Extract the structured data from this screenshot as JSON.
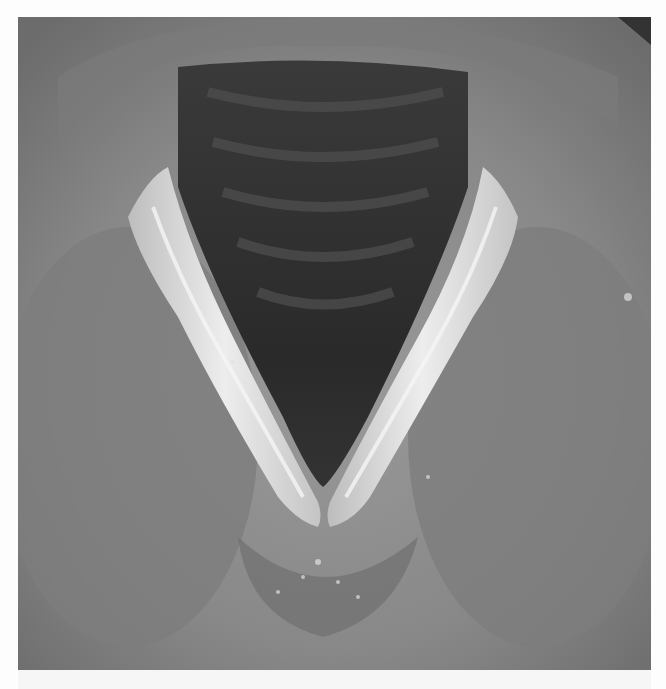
{
  "image": {
    "subject": "endoscopic view of larynx with vocal folds",
    "color_mode": "grayscale",
    "colors": {
      "tissue": "#8a8a8a",
      "tissue_dark": "#6e6e6e",
      "airway": "#2e2e2e",
      "airway_ring": "#4a4a4a",
      "vocal_fold": "#d6d6d6",
      "vocal_fold_highlight": "#f2f2f2",
      "corner_shadow": "#3a3a3a",
      "background": "#fdfdfd"
    }
  }
}
